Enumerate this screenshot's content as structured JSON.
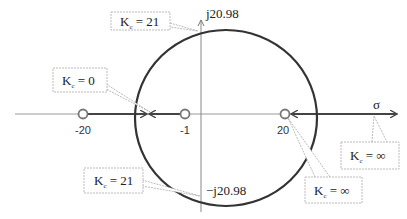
{
  "diagram": {
    "type": "root-locus",
    "axes": {
      "real_axis_label": "σ",
      "imag_top_label": "j20.98",
      "imag_bottom_label": "−j20.98"
    },
    "points": [
      {
        "kind": "zero",
        "value": -20,
        "label": "-20"
      },
      {
        "kind": "pole",
        "value": -1,
        "label": "-1"
      },
      {
        "kind": "zero",
        "value": 20,
        "label": "20"
      }
    ],
    "callouts": [
      {
        "id": "top-crossing",
        "text_k": "K",
        "sub": "c",
        "text_rest": " = 21"
      },
      {
        "id": "breakaway",
        "text_k": "K",
        "sub": "c",
        "text_rest": " = 0"
      },
      {
        "id": "bottom-crossing",
        "text_k": "K",
        "sub": "c",
        "text_rest": " = 21"
      },
      {
        "id": "right-infinity",
        "text_k": "K",
        "sub": "c",
        "text_rest": " = ∞"
      },
      {
        "id": "zero-infinity",
        "text_k": "K",
        "sub": "c",
        "text_rest": " = ∞"
      }
    ],
    "colors": {
      "locus": "#333333",
      "axis": "#999999",
      "callout_border": "#aaaaaa"
    }
  }
}
